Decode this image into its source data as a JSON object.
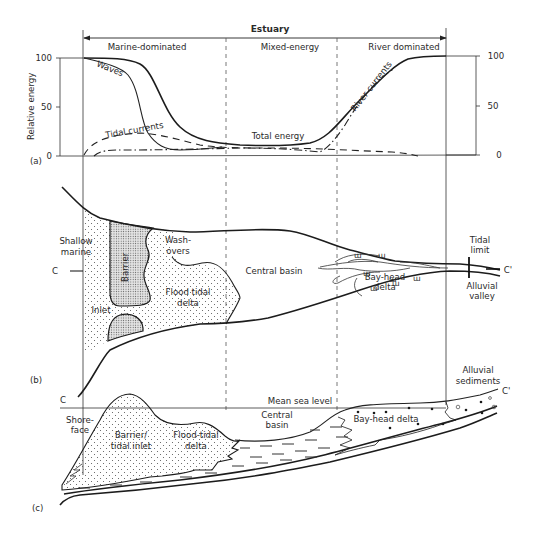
{
  "figure": {
    "title": "Estuary",
    "zones": [
      {
        "label": "Marine-dominated"
      },
      {
        "label": "Mixed-energy"
      },
      {
        "label": "River dominated"
      }
    ],
    "panel_labels": {
      "a": "(a)",
      "b": "(b)",
      "c": "(c)"
    }
  },
  "panel_a": {
    "y_axis_label": "Relative energy",
    "left_ticks": [
      "100",
      "50",
      "0"
    ],
    "right_ticks": [
      "100",
      "50",
      "0"
    ],
    "curves": {
      "waves": "Waves",
      "tidal_currents": "Tidal currents",
      "total_energy": "Total energy",
      "river_currents": "River currents"
    }
  },
  "panel_b": {
    "labels": {
      "shallow_marine_1": "Shallow",
      "shallow_marine_2": "marine",
      "barrier": "Barrier",
      "washovers_1": "Wash-",
      "washovers_2": "overs",
      "flood_tidal_delta_1": "Flood tidal",
      "flood_tidal_delta_2": "delta",
      "inlet": "Inlet",
      "central_basin": "Central basin",
      "bay_head_delta_1": "Bay-head",
      "bay_head_delta_2": "delta",
      "tidal_limit_1": "Tidal",
      "tidal_limit_2": "limit",
      "alluvial_valley_1": "Alluvial",
      "alluvial_valley_2": "valley",
      "section_start": "C",
      "section_end": "C'"
    }
  },
  "panel_c": {
    "labels": {
      "section_start": "C",
      "section_end": "C'",
      "mean_sea_level": "Mean sea level",
      "shoreface_1": "Shore-",
      "shoreface_2": "face",
      "barrier_inlet_1": "Barrier/",
      "barrier_inlet_2": "tidal inlet",
      "flood_tidal_delta_1": "Flood-tidal",
      "flood_tidal_delta_2": "delta",
      "central_basin_1": "Central",
      "central_basin_2": "basin",
      "bay_head_delta": "Bay-head delta",
      "alluvial_sediments_1": "Alluvial",
      "alluvial_sediments_2": "sediments"
    }
  }
}
